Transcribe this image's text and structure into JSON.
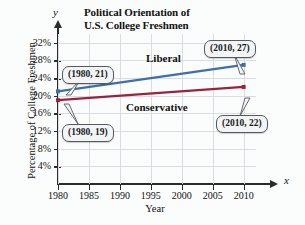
{
  "chart_data": {
    "type": "line",
    "title": "Political Orientation of U.S. College Freshmen",
    "title_lines": [
      "Political Orientation of",
      "U.S. College Freshmen"
    ],
    "xlabel": "Year",
    "ylabel": "Percentage of College Freshmen",
    "x_axis_letter": "x",
    "y_axis_letter": "y",
    "x": [
      1980,
      2010
    ],
    "xlim": [
      1980,
      2012
    ],
    "ylim": [
      0,
      34
    ],
    "xticks": [
      1980,
      1985,
      1990,
      1995,
      2000,
      2005,
      2010
    ],
    "xticklabels": [
      "1980",
      "1985",
      "1990",
      "1995",
      "2000",
      "2005",
      "2010"
    ],
    "yticks": [
      4,
      8,
      12,
      16,
      20,
      24,
      28,
      32
    ],
    "yticklabels": [
      "4%",
      "8%",
      "12%",
      "16%",
      "20%",
      "24%",
      "28%",
      "32%"
    ],
    "grid": true,
    "legend_position": "inline-labels",
    "series": [
      {
        "name": "Liberal",
        "values": [
          21,
          27
        ],
        "color": "#3d6fae"
      },
      {
        "name": "Conservative",
        "values": [
          19,
          22
        ],
        "color": "#99243f"
      }
    ],
    "annotations": [
      {
        "label": "(1980, 21)",
        "x": 1980,
        "y": 21,
        "series": "Liberal"
      },
      {
        "label": "(2010, 27)",
        "x": 2010,
        "y": 27,
        "series": "Liberal"
      },
      {
        "label": "(1980, 19)",
        "x": 1980,
        "y": 19,
        "series": "Conservative"
      },
      {
        "label": "(2010, 22)",
        "x": 2010,
        "y": 22,
        "series": "Conservative"
      }
    ]
  },
  "colors": {
    "liberal": "#3d6fae",
    "conservative": "#99243f",
    "axis": "#2b2b2b",
    "grid": "#d9dde1",
    "callout_fill": "#f2f4f6",
    "callout_border": "#555a60",
    "background": "#fbfcfc"
  }
}
